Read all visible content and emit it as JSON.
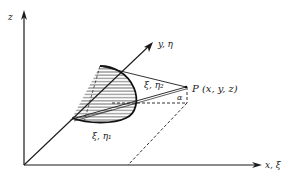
{
  "diagram": {
    "title": "",
    "axes": {
      "z": {
        "label": "z"
      },
      "y": {
        "label": "y, η"
      },
      "x": {
        "label": "x, ξ"
      }
    },
    "point": {
      "label": "P (x, y, z)"
    },
    "region_points": {
      "upper": {
        "label": "ξ, η₂"
      },
      "lower": {
        "label": "ξ, η₁"
      }
    },
    "angle": {
      "label": "α"
    },
    "colors": {
      "stroke": "#1a1a1a",
      "background": "#ffffff"
    }
  }
}
